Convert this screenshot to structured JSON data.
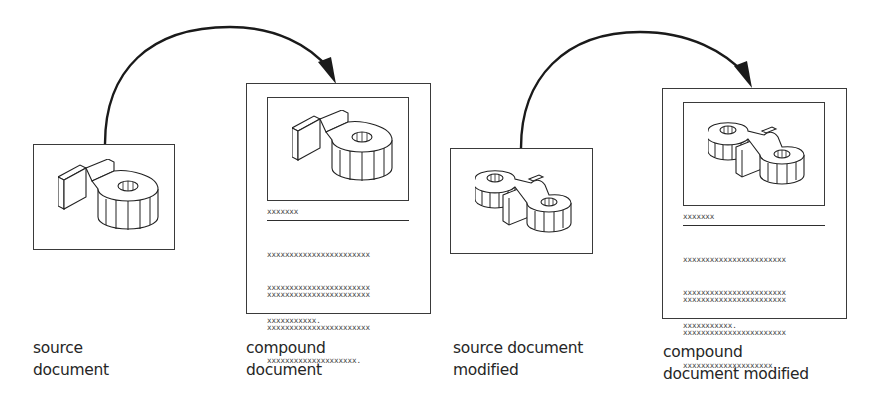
{
  "diagram": {
    "panels": [
      {
        "id": "source-document",
        "kind": "source",
        "part": "single-boss-bracket",
        "label_lines": [
          "source",
          "document"
        ]
      },
      {
        "id": "compound-document",
        "kind": "compound",
        "part": "single-boss-bracket",
        "heading": "xxxxxxx",
        "paragraphs": [
          [
            "xxxxxxxxxxxxxxxxxxxxxxx",
            "xxxxxxxxxxxxxxxxxxxxxxx",
            "xxxxxxxxxxx."
          ],
          [
            "xxxxxxxxxxxxxxxxxxxxxxx",
            "xxxxxxxxxxxxxxxxxxxxxxx",
            "xxxxxxxxxxxxxxxxxxxx."
          ]
        ],
        "label_lines": [
          "compound",
          "document"
        ]
      },
      {
        "id": "source-document-modified",
        "kind": "source",
        "part": "double-boss-link",
        "label_lines": [
          "source document",
          "modified"
        ]
      },
      {
        "id": "compound-document-modified",
        "kind": "compound",
        "part": "double-boss-link",
        "heading": "xxxxxxx",
        "paragraphs": [
          [
            "xxxxxxxxxxxxxxxxxxxxxxx",
            "xxxxxxxxxxxxxxxxxxxxxxx",
            "xxxxxxxxxxx."
          ],
          [
            "xxxxxxxxxxxxxxxxxxxxxxx",
            "xxxxxxxxxxxxxxxxxxxxxxx",
            "xxxxxxxxxxxxxxxxxxxx."
          ]
        ],
        "label_lines": [
          "compound",
          "document modified"
        ]
      }
    ],
    "arrows": [
      {
        "from": "source-document",
        "to": "compound-document"
      },
      {
        "from": "source-document-modified",
        "to": "compound-document-modified"
      }
    ],
    "colors": {
      "line": "#1a1a1a",
      "text": "#262626",
      "placeholder_text": "#3d3d3d",
      "background": "#ffffff"
    }
  }
}
